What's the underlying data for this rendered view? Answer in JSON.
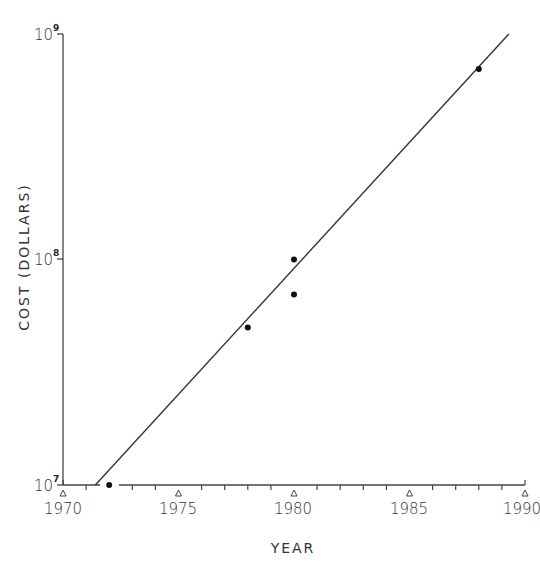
{
  "chart_data": {
    "type": "scatter",
    "title": "",
    "xlabel": "YEAR",
    "ylabel": "COST (DOLLARS)",
    "yscale": "log",
    "xlim": [
      1970,
      1990
    ],
    "ylim": [
      10000000,
      1000000000
    ],
    "x_ticks": [
      "1970",
      "1975",
      "1980",
      "1985",
      "1990"
    ],
    "y_ticks": [
      {
        "base": "10",
        "exp": "7",
        "value": 10000000
      },
      {
        "base": "10",
        "exp": "8",
        "value": 100000000
      },
      {
        "base": "10",
        "exp": "9",
        "value": 1000000000
      }
    ],
    "grid": false,
    "legend": null,
    "series": [
      {
        "name": "data points",
        "type": "scatter",
        "points": [
          {
            "x": 1972,
            "y": 10000000
          },
          {
            "x": 1978,
            "y": 50000000
          },
          {
            "x": 1980,
            "y": 100000000
          },
          {
            "x": 1980,
            "y": 70000000
          },
          {
            "x": 1988,
            "y": 700000000
          }
        ]
      },
      {
        "name": "trend line",
        "type": "line",
        "points": [
          {
            "x": 1971.4,
            "y": 10000000
          },
          {
            "x": 1989.3,
            "y": 1000000000
          }
        ]
      }
    ]
  }
}
